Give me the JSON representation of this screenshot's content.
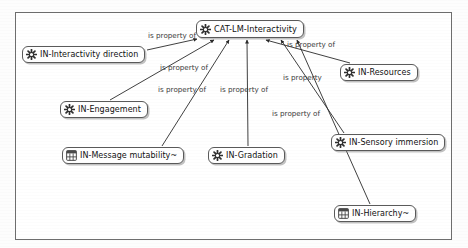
{
  "diagram": {
    "type": "concept-map",
    "frame": {
      "visible": true
    },
    "central_node": {
      "id": "cat-lm-interactivity",
      "label": "CAT-LM-Interactivity",
      "icon": "gear-icon",
      "x": 196,
      "y": 20,
      "w": 110,
      "h": 18
    },
    "nodes": [
      {
        "id": "in-interactivity-direction",
        "label": "IN-Interactivity direction",
        "icon": "gear-icon",
        "x": 22,
        "y": 46,
        "w": 124,
        "h": 17
      },
      {
        "id": "in-engagement",
        "label": "IN-Engagement",
        "icon": "gear-icon",
        "x": 60,
        "y": 101,
        "w": 88,
        "h": 17
      },
      {
        "id": "in-message-mutability",
        "label": "IN-Message mutability~",
        "icon": "table-icon",
        "x": 62,
        "y": 147,
        "w": 123,
        "h": 17
      },
      {
        "id": "in-gradation",
        "label": "IN-Gradation",
        "icon": "gear-icon",
        "x": 208,
        "y": 147,
        "w": 84,
        "h": 17
      },
      {
        "id": "in-resources",
        "label": "IN-Resources",
        "icon": "gear-icon",
        "x": 340,
        "y": 64,
        "w": 86,
        "h": 17
      },
      {
        "id": "in-sensory-immersion",
        "label": "IN-Sensory immersion",
        "icon": "gear-icon",
        "x": 331,
        "y": 134,
        "w": 117,
        "h": 17
      },
      {
        "id": "in-hierarchy",
        "label": "IN-Hierarchy~",
        "icon": "table-icon",
        "x": 334,
        "y": 205,
        "w": 84,
        "h": 17
      }
    ],
    "edges": [
      {
        "from": "in-interactivity-direction",
        "to": "cat-lm-interactivity",
        "label": "is property of",
        "label_x": 148,
        "label_y": 38,
        "x1": 147,
        "y1": 50,
        "x2": 197,
        "y2": 39
      },
      {
        "from": "in-engagement",
        "to": "cat-lm-interactivity",
        "label": "is property of",
        "label_x": 160,
        "label_y": 70,
        "x1": 110,
        "y1": 100,
        "x2": 214,
        "y2": 40
      },
      {
        "from": "in-message-mutability",
        "to": "cat-lm-interactivity",
        "label": "is property of",
        "label_x": 158,
        "label_y": 92,
        "x1": 162,
        "y1": 146,
        "x2": 229,
        "y2": 40
      },
      {
        "from": "in-gradation",
        "to": "cat-lm-interactivity",
        "label": "is property of",
        "label_x": 220,
        "label_y": 92,
        "x1": 248,
        "y1": 146,
        "x2": 247,
        "y2": 40
      },
      {
        "from": "in-resources",
        "to": "cat-lm-interactivity",
        "label": "is property of",
        "label_x": 287,
        "label_y": 47,
        "x1": 350,
        "y1": 63,
        "x2": 266,
        "y2": 40
      },
      {
        "from": "in-sensory-immersion",
        "to": "cat-lm-interactivity",
        "label": "is property",
        "label_x": 283,
        "label_y": 80,
        "x1": 344,
        "y1": 133,
        "x2": 281,
        "y2": 40
      },
      {
        "from": "in-hierarchy",
        "to": "cat-lm-interactivity",
        "label": "is property of",
        "label_x": 272,
        "label_y": 116,
        "x1": 370,
        "y1": 204,
        "x2": 297,
        "y2": 40
      }
    ]
  }
}
